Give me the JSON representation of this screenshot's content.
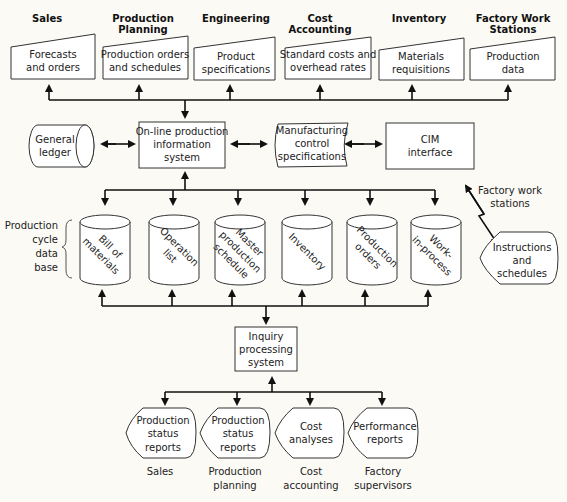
{
  "departments": [
    {
      "header": [
        "Sales"
      ],
      "input": [
        "Forecasts",
        "and orders"
      ]
    },
    {
      "header": [
        "Production",
        "Planning"
      ],
      "input": [
        "Production orders",
        "and schedules"
      ]
    },
    {
      "header": [
        "Engineering"
      ],
      "input": [
        "Product",
        "specifications"
      ]
    },
    {
      "header": [
        "Cost",
        "Accounting"
      ],
      "input": [
        "Standard costs and",
        "overhead rates"
      ]
    },
    {
      "header": [
        "Inventory"
      ],
      "input": [
        "Materials",
        "requisitions"
      ]
    },
    {
      "header": [
        "Factory Work",
        "Stations"
      ],
      "input": [
        "Production",
        "data"
      ]
    }
  ],
  "middle": {
    "general_ledger": [
      "General",
      "ledger"
    ],
    "online_system": [
      "On-line production",
      "information",
      "system"
    ],
    "mfg_control": [
      "Manufacturing",
      "control",
      "specifications"
    ],
    "cim": [
      "CIM",
      "interface"
    ]
  },
  "database": {
    "label": [
      "Production",
      "cycle",
      "data",
      "base"
    ],
    "files": [
      [
        "Bill of",
        "materials"
      ],
      [
        "Operation",
        "list"
      ],
      [
        "Master",
        "production",
        "schedule"
      ],
      [
        "Inventory"
      ],
      [
        "Production",
        "orders"
      ],
      [
        "Work-",
        "in-process"
      ]
    ]
  },
  "factory_link": {
    "label": [
      "Factory work",
      "stations"
    ],
    "output": [
      "Instructions",
      "and",
      "schedules"
    ]
  },
  "inquiry": [
    "Inquiry",
    "processing",
    "system"
  ],
  "reports": [
    {
      "doc": [
        "Production",
        "status",
        "reports"
      ],
      "recipient": [
        "Sales"
      ]
    },
    {
      "doc": [
        "Production",
        "status",
        "reports"
      ],
      "recipient": [
        "Production",
        "planning"
      ]
    },
    {
      "doc": [
        "Cost",
        "analyses"
      ],
      "recipient": [
        "Cost",
        "accounting"
      ]
    },
    {
      "doc": [
        "Performance",
        "reports"
      ],
      "recipient": [
        "Factory",
        "supervisors"
      ]
    }
  ]
}
